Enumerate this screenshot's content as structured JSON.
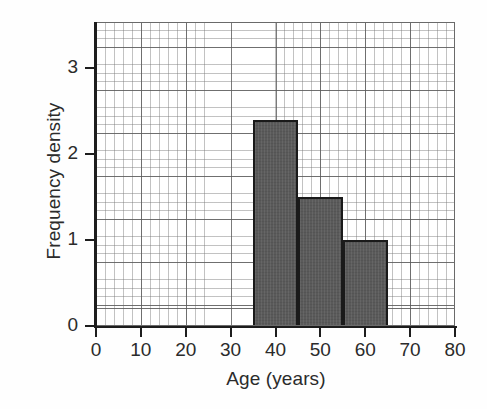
{
  "chart_data": {
    "type": "bar",
    "title": "",
    "xlabel": "Age (years)",
    "ylabel": "Frequency density",
    "xlim": [
      0,
      80
    ],
    "ylim": [
      0,
      3.5
    ],
    "grid": true,
    "grid_style": "graph-paper (minor cells with major lines every 5 cells)",
    "legend": "none",
    "bar_fill_color": "#5a5a5a",
    "bar_edge_color": "#1a1a1a",
    "axis_color": "#1d1d1d",
    "categories": [
      "35-45",
      "45-55",
      "55-65"
    ],
    "values": [
      2.4,
      1.5,
      1.0
    ],
    "bins": [
      {
        "label": "35-45",
        "x_start": 35,
        "x_end": 45,
        "frequency_density": 2.4,
        "width": 10,
        "frequency": 24
      },
      {
        "label": "45-55",
        "x_start": 45,
        "x_end": 55,
        "frequency_density": 1.5,
        "width": 10,
        "frequency": 15
      },
      {
        "label": "55-65",
        "x_start": 55,
        "x_end": 65,
        "frequency_density": 1.0,
        "width": 10,
        "frequency": 10
      }
    ],
    "xticks": [
      0,
      10,
      20,
      30,
      40,
      50,
      60,
      70,
      80
    ],
    "xticklabels": [
      "0",
      "10",
      "20",
      "30",
      "40",
      "50",
      "60",
      "70",
      "80"
    ],
    "yticks": [
      0,
      1,
      2,
      3
    ],
    "yticklabels": [
      "0",
      "1",
      "2",
      "3"
    ]
  }
}
